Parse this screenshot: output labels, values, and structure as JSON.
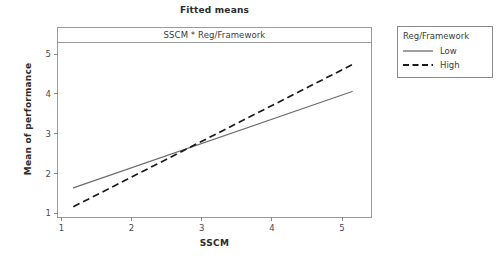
{
  "chart_data": {
    "type": "line",
    "title": "Fitted means",
    "panel_header": "SSCM * Reg/Framework",
    "xlabel": "SSCM",
    "ylabel": "Mean of performance",
    "xlim": [
      0.78,
      5.27
    ],
    "ylim": [
      0.86,
      5.28
    ],
    "xticks": [
      "1",
      "2",
      "3",
      "4",
      "5"
    ],
    "xtick_values": [
      1,
      2,
      3,
      4,
      5
    ],
    "yticks": [
      "1",
      "2",
      "3",
      "4",
      "5"
    ],
    "ytick_values": [
      1,
      2,
      3,
      4,
      5
    ],
    "grid": false,
    "legend_position": "right-outside",
    "legend_title": "Reg/Framework",
    "x": [
      1,
      5
    ],
    "series": [
      {
        "name": "Low",
        "style": "solid",
        "color": "#6b6b6b",
        "values": [
          1.6,
          4.05
        ]
      },
      {
        "name": "High",
        "style": "dashed",
        "color": "#1a1a1a",
        "values": [
          1.12,
          4.73
        ]
      }
    ],
    "crossover": {
      "x": 2.5,
      "y": 2.45
    }
  },
  "colors": {
    "frame": "#9a9a9a",
    "low_line": "#6b6b6b",
    "high_line": "#1a1a1a",
    "text": "#3a3a3a",
    "background": "#ffffff"
  }
}
